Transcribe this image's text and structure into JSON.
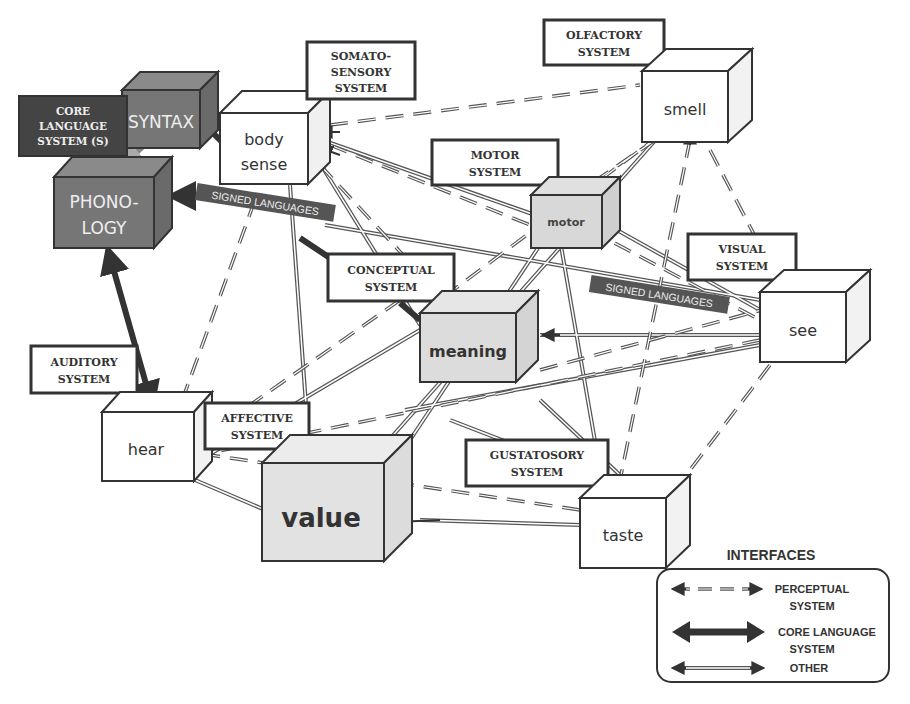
{
  "colors": {
    "core_dark": "#5a5a5a",
    "core_mid": "#6e6e6e",
    "core_light": "#8a8a8a",
    "core_label_bg": "#444444",
    "meaning_fill": "#dcdcdc",
    "value_fill": "#e2e2e2",
    "motor_fill": "#d6d6d6",
    "white_fill": "#ffffff",
    "stroke": "#333333",
    "banner_bg": "#555555"
  },
  "system_labels": {
    "core_language": [
      "CORE",
      "LANGUAGE",
      "SYSTEM (S)"
    ],
    "somatosensory": [
      "SOMATO-",
      "SENSORY",
      "SYSTEM"
    ],
    "olfactory": [
      "OLFACTORY",
      "SYSTEM"
    ],
    "motor": [
      "MOTOR",
      "SYSTEM"
    ],
    "visual": [
      "VISUAL",
      "SYSTEM"
    ],
    "conceptual": [
      "CONCEPTUAL",
      "SYSTEM"
    ],
    "auditory": [
      "AUDITORY",
      "SYSTEM"
    ],
    "affective": [
      "AFFECTIVE",
      "SYSTEM"
    ],
    "gustatory": [
      "GUSTATOSORY",
      "SYSTEM"
    ]
  },
  "nodes": {
    "syntax": "SYNTAX",
    "phonology": [
      "PHONO-",
      "LOGY"
    ],
    "body_sense": [
      "body",
      "sense"
    ],
    "smell": "smell",
    "motor": "motor",
    "meaning": "meaning",
    "see": "see",
    "hear": "hear",
    "value": "value",
    "taste": "taste"
  },
  "banners": {
    "signed_languages_left": "SIGNED LANGUAGES",
    "signed_languages_right": "SIGNED LANGUAGES"
  },
  "legend": {
    "title": "INTERFACES",
    "items": [
      {
        "type": "dashed",
        "label": [
          "PERCEPTUAL",
          "SYSTEM"
        ]
      },
      {
        "type": "bold",
        "label": [
          "CORE LANGUAGE",
          "SYSTEM"
        ]
      },
      {
        "type": "double",
        "label": [
          "OTHER"
        ]
      }
    ]
  }
}
